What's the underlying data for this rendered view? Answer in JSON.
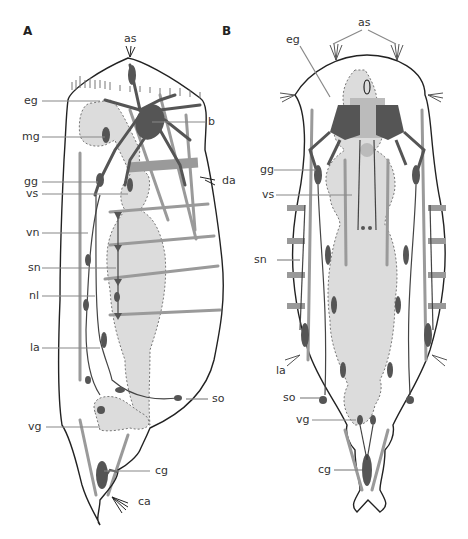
{
  "panels": [
    {
      "id": "A",
      "label": "A",
      "leaders": [
        {
          "key": "as",
          "text": "as"
        },
        {
          "key": "eg",
          "text": "eg"
        },
        {
          "key": "b",
          "text": "b"
        },
        {
          "key": "mg",
          "text": "mg"
        },
        {
          "key": "gg",
          "text": "gg"
        },
        {
          "key": "da",
          "text": "da"
        },
        {
          "key": "vs",
          "text": "vs"
        },
        {
          "key": "vn",
          "text": "vn"
        },
        {
          "key": "sn",
          "text": "sn"
        },
        {
          "key": "nl",
          "text": "nl"
        },
        {
          "key": "la",
          "text": "la"
        },
        {
          "key": "so",
          "text": "so"
        },
        {
          "key": "vg",
          "text": "vg"
        },
        {
          "key": "cg",
          "text": "cg"
        },
        {
          "key": "ca",
          "text": "ca"
        }
      ]
    },
    {
      "id": "B",
      "label": "B",
      "leaders": [
        {
          "key": "as",
          "text": "as"
        },
        {
          "key": "eg",
          "text": "eg"
        },
        {
          "key": "gg",
          "text": "gg"
        },
        {
          "key": "vs",
          "text": "vs"
        },
        {
          "key": "sn",
          "text": "sn"
        },
        {
          "key": "la",
          "text": "la"
        },
        {
          "key": "so",
          "text": "so"
        },
        {
          "key": "vg",
          "text": "vg"
        },
        {
          "key": "cg",
          "text": "cg"
        }
      ]
    }
  ],
  "colors": {
    "outline": "#222222",
    "nerve_dark": "#555555",
    "muscle_gray": "#9a9a9a",
    "organ_fill": "#d9d9d9",
    "organ_dash": "#777777",
    "leader": "#888888"
  }
}
